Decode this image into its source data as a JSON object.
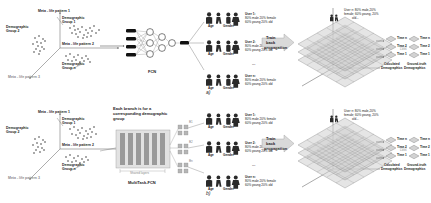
{
  "figure": {
    "panel_a_tag": "a)",
    "panel_b_tag": "b)"
  },
  "scatter": {
    "axis_labels": [
      "Meta - life pattern 1",
      "Meta - life pattern 2",
      "Meta - life pattern 3"
    ],
    "clusters": [
      {
        "name": "Demographic Group 1",
        "label_line1": "Demographic",
        "label_line2": "Group 1"
      },
      {
        "name": "Demographic Group 2",
        "label_line1": "Demographic",
        "label_line2": "Group 2"
      },
      {
        "name": "Demographic Group n",
        "label_line1": "Demographic",
        "label_line2": "Group n"
      }
    ]
  },
  "network_a": {
    "name": "FCN",
    "caption": "FCN",
    "input_units": 4,
    "hidden_units": 3,
    "hidden2_units": 2,
    "output_units": 1
  },
  "network_b": {
    "name": "MultiTask-FCN",
    "caption": "MultiTask-FCN",
    "annotation": "Each branch is for a corresponding demographic group",
    "shared_label": "Shared layers",
    "branch_labels": [
      "B1",
      "B2",
      "Bn"
    ],
    "shared_columns": 6
  },
  "predictions": {
    "age_label": "Age",
    "gender_label": "Gender",
    "users": [
      {
        "title": "User 1:",
        "line1": "80% male 20% female",
        "line2": "60% young 20% old",
        "pct_top": "80%",
        "pct_bottom": "60%"
      },
      {
        "title": "User 2:",
        "line1": "80% male 20% female",
        "line2": "60% young 20% old",
        "pct_top": "20%",
        "pct_bottom": "20%"
      },
      {
        "title": "User n:",
        "line1": "80% male 20% female",
        "line2": "60% young 20% old",
        "pct_top": "30%",
        "pct_bottom": "40%"
      }
    ],
    "ellipsis": "..."
  },
  "train": {
    "line1": "Train",
    "line2": "back",
    "line3": "propagation"
  },
  "grid": {
    "annotation_line1": "User n: 80% male,20%",
    "annotation_line2": "female; 60% young, 20%",
    "annotation_line3": "old...",
    "calculated_title_line1": "Calculated",
    "calculated_title_line2": "Demographics",
    "ground_truth_title_line1": "Ground-truth",
    "ground_truth_title_line2": "Demographics",
    "loss_label": "Loss",
    "time_labels": [
      "Time n",
      "Time 2",
      "Time 1"
    ],
    "layers": 3
  },
  "colors": {
    "ink": "#1a1a1a",
    "gray": "#8a8a8a",
    "mesh": "#6e6e6e",
    "arrow_fill": "#d9d9d9",
    "bar_fill": "#9a9a9a",
    "node_stroke": "#2a2a2a"
  }
}
